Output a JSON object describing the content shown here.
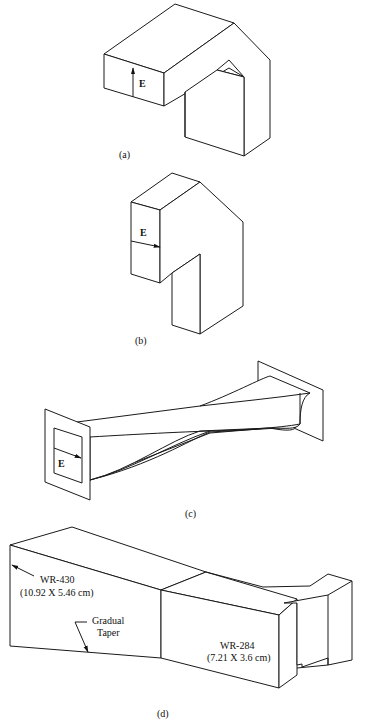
{
  "figure": {
    "panels": [
      {
        "id": "a",
        "caption": "(a)",
        "field_label": "E",
        "field_direction": "vertical-up",
        "description": "E-plane waveguide bend"
      },
      {
        "id": "b",
        "caption": "(b)",
        "field_label": "E",
        "field_direction": "horizontal-right",
        "description": "H-plane waveguide bend"
      },
      {
        "id": "c",
        "caption": "(c)",
        "field_label": "E",
        "field_direction": "horizontal-right",
        "description": "Waveguide twist"
      },
      {
        "id": "d",
        "caption": "(d)",
        "description": "Waveguide taper transition",
        "annotations": {
          "large_guide": "WR-430",
          "large_guide_dims": "(10.92 X 5.46 cm)",
          "taper_line1": "Gradual",
          "taper_line2": "Taper",
          "small_guide": "WR-284",
          "small_guide_dims": "(7.21 X 3.6 cm)"
        }
      }
    ],
    "colors": {
      "line": "#1a1a1a",
      "background": "#ffffff"
    }
  }
}
